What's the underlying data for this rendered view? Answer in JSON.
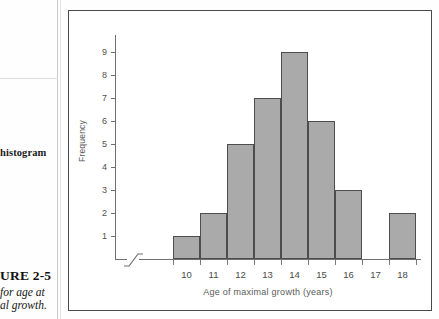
{
  "margin": {
    "note": "histogram"
  },
  "caption": {
    "figure_number": "URE 2-5",
    "description_line1": "for age at",
    "description_line2": "al growth."
  },
  "chart_data": {
    "type": "bar",
    "title": "",
    "xlabel": "Age of maximal growth (years)",
    "ylabel": "Frequency",
    "categories": [
      "10",
      "11",
      "12",
      "13",
      "14",
      "15",
      "16",
      "17",
      "18"
    ],
    "values": [
      1,
      2,
      5,
      7,
      9,
      6,
      3,
      0,
      2
    ],
    "yticks": [
      "1",
      "2",
      "3",
      "4",
      "5",
      "6",
      "7",
      "8",
      "9"
    ],
    "ylim": [
      0,
      9.6
    ],
    "grid": false,
    "legend": "none",
    "axis_break": true,
    "bar_fill": "#aaaaaa",
    "bar_stroke": "#4d4d4d",
    "axis_color": "#6f6f6f"
  }
}
